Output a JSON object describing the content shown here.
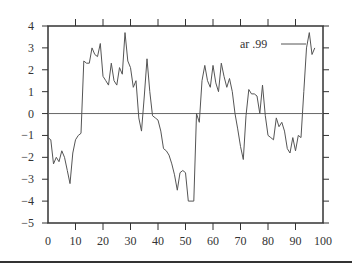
{
  "chart_data": {
    "type": "line",
    "title": "",
    "xlabel": "",
    "ylabel": "",
    "xlim": [
      0,
      100
    ],
    "ylim": [
      -5,
      4
    ],
    "x_ticks": [
      0,
      10,
      20,
      30,
      40,
      50,
      60,
      70,
      80,
      90,
      100
    ],
    "y_ticks": [
      4,
      3,
      2,
      1,
      0,
      -1,
      -2,
      -3,
      -4,
      -5
    ],
    "grid": false,
    "zero_line": true,
    "legend": {
      "position": "upper right",
      "entries": [
        "ar .99"
      ]
    },
    "series": [
      {
        "name": "ar .99",
        "x": [
          0,
          1,
          2,
          3,
          4,
          5,
          6,
          7,
          8,
          9,
          10,
          11,
          12,
          13,
          14,
          15,
          16,
          17,
          18,
          19,
          20,
          21,
          22,
          23,
          24,
          25,
          26,
          27,
          28,
          29,
          30,
          31,
          32,
          33,
          34,
          35,
          36,
          37,
          38,
          39,
          40,
          41,
          42,
          43,
          44,
          45,
          46,
          47,
          48,
          49,
          50,
          51,
          52,
          53,
          54,
          55,
          56,
          57,
          58,
          59,
          60,
          61,
          62,
          63,
          64,
          65,
          66,
          67,
          68,
          69,
          70,
          71,
          72,
          73,
          74,
          75,
          76,
          77,
          78,
          79,
          80,
          81,
          82,
          83,
          84,
          85,
          86,
          87,
          88,
          89,
          90,
          91,
          92,
          93,
          94,
          95,
          96,
          97
        ],
        "values": [
          -1.1,
          -1.2,
          -2.3,
          -2.0,
          -2.2,
          -1.7,
          -2.0,
          -2.6,
          -3.2,
          -1.8,
          -1.2,
          -1.0,
          -0.9,
          2.4,
          2.3,
          2.3,
          3.0,
          2.7,
          2.6,
          3.2,
          1.7,
          1.5,
          1.3,
          2.3,
          1.5,
          1.3,
          2.1,
          1.8,
          3.7,
          2.4,
          2.1,
          1.2,
          1.5,
          -0.2,
          -0.8,
          0.8,
          2.5,
          1.0,
          -0.1,
          -0.2,
          -0.3,
          -0.8,
          -1.6,
          -1.7,
          -1.9,
          -2.3,
          -2.8,
          -3.5,
          -2.7,
          -2.6,
          -2.7,
          -4.0,
          -4.0,
          -4.0,
          0.0,
          -0.4,
          1.5,
          2.2,
          1.5,
          1.2,
          2.2,
          1.4,
          1.0,
          2.3,
          1.7,
          1.2,
          1.6,
          1.0,
          0.0,
          -0.7,
          -1.5,
          -2.1,
          -0.1,
          1.1,
          0.9,
          0.9,
          0.8,
          0.0,
          1.3,
          -0.1,
          -1.0,
          -1.1,
          -1.2,
          -0.2,
          -0.6,
          -0.4,
          -0.8,
          -1.6,
          -1.8,
          -1.1,
          -1.7,
          -1.0,
          -1.1,
          1.0,
          3.0,
          3.7,
          2.7,
          3.0
        ]
      }
    ]
  },
  "axes": {
    "x_labels": [
      "0",
      "10",
      "20",
      "30",
      "40",
      "50",
      "60",
      "70",
      "80",
      "90",
      "100"
    ],
    "y_labels": [
      "4",
      "3",
      "2",
      "1",
      "0",
      "−1",
      "−2",
      "−3",
      "−4",
      "−5"
    ]
  },
  "legend": {
    "label": "ar .99"
  }
}
